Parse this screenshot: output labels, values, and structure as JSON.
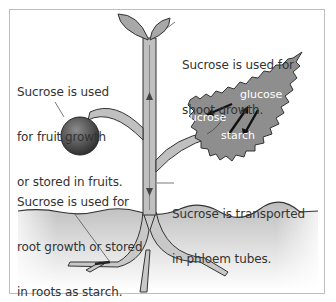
{
  "diagram": {
    "labels": {
      "fruit": [
        "Sucrose is used",
        "for fruit growth",
        "or stored in fruits."
      ],
      "shoot": [
        "Sucrose is used for",
        "shoot growth."
      ],
      "root": [
        "Sucrose is used for",
        "root growth or stored",
        "in roots as starch."
      ],
      "phloem": [
        "Sucrose is transported",
        "in phloem tubes."
      ]
    },
    "leaf_words": {
      "glucose": "glucose",
      "sucrose": "sucrose",
      "starch": "starch"
    },
    "colors": {
      "leaf": "#8a8a8a",
      "stem": "#b5b5b5",
      "outline": "#333333",
      "soil": "#c8c8c8",
      "fruit": "#555555"
    }
  }
}
